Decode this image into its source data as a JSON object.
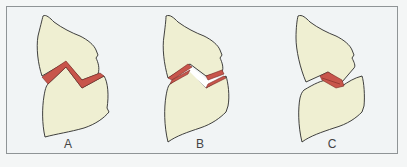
{
  "figure": {
    "panels": [
      {
        "id": "A",
        "label": "A",
        "description": "Normal joint: articular cartilage caps in contact, congruent zig-zag surfaces"
      },
      {
        "id": "B",
        "label": "B",
        "description": "Joint with gap between cartilage caps (space between surfaces)"
      },
      {
        "id": "C",
        "label": "C",
        "description": "Joint with cartilage contact at a single narrow region"
      }
    ]
  },
  "colors": {
    "background": "#f1f4f5",
    "frame_border": "#8f9496",
    "bone_fill": "#efefd2",
    "bone_stroke": "#2b2b2b",
    "cartilage_fill": "#c8554b",
    "cartilage_stroke": "#7a2a24",
    "label_text": "#444444"
  }
}
